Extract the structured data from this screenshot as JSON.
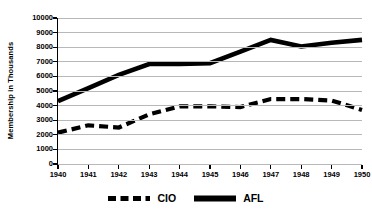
{
  "chart_data": {
    "type": "line",
    "title": "",
    "subtitle": "",
    "xlabel": "",
    "ylabel": "Membership in Thousands",
    "x": [
      1940,
      1941,
      1942,
      1943,
      1944,
      1945,
      1946,
      1947,
      1948,
      1949,
      1950
    ],
    "categories": [
      "1940",
      "1941",
      "1942",
      "1943",
      "1944",
      "1945",
      "1946",
      "1947",
      "1948",
      "1949",
      "1950"
    ],
    "series": [
      {
        "name": "CIO",
        "style": "dashed",
        "color": "#000000",
        "values": [
          2150,
          2650,
          2500,
          3400,
          3950,
          3950,
          3900,
          4450,
          4450,
          4350,
          3700
        ]
      },
      {
        "name": "AFL",
        "style": "solid",
        "color": "#000000",
        "values": [
          4300,
          5200,
          6100,
          6850,
          6850,
          6900,
          7700,
          8500,
          8050,
          8300,
          8500
        ]
      }
    ],
    "ylim": [
      0,
      10000
    ],
    "ytick_step": 1000,
    "yticks": [
      0,
      1000,
      2000,
      3000,
      4000,
      5000,
      6000,
      7000,
      8000,
      9000,
      10000
    ],
    "ytick_labels": [
      "0",
      "1000",
      "2000",
      "3000",
      "4000",
      "5000",
      "6000",
      "7000",
      "8000",
      "9000",
      "10000"
    ],
    "xlim": [
      1940,
      1950
    ],
    "grid": "horizontal",
    "grid_color": "#b8b8b8",
    "legend_position": "bottom",
    "legend": [
      "CIO",
      "AFL"
    ],
    "annotations": []
  },
  "legend": {
    "entries": [
      {
        "label": "CIO",
        "swatch": "dashed-line-swatch"
      },
      {
        "label": "AFL",
        "swatch": "solid-line-swatch"
      }
    ]
  }
}
